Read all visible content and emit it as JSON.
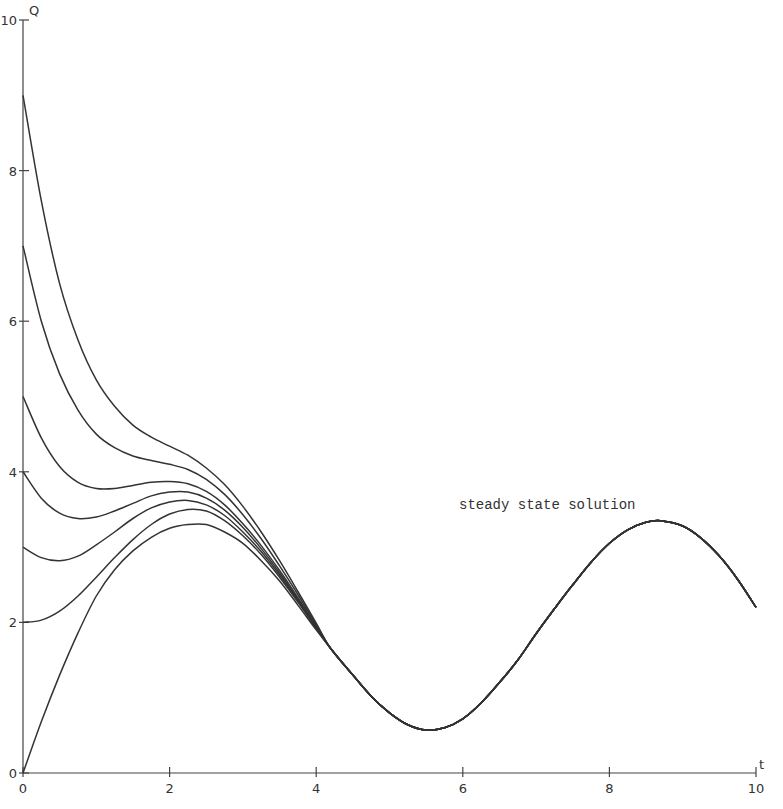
{
  "chart_data": {
    "type": "line",
    "title": "",
    "xlabel": "t",
    "ylabel": "Q",
    "xlim": [
      0,
      10
    ],
    "ylim": [
      0,
      10
    ],
    "x_ticks": [
      0,
      2,
      4,
      6,
      8,
      10
    ],
    "y_ticks": [
      0,
      2,
      4,
      6,
      8,
      10
    ],
    "grid": false,
    "legend": null,
    "annotations": [
      {
        "text": "steady state solution",
        "x": 5.95,
        "y": 3.8
      }
    ],
    "steady_state_tail": [
      [
        4.2,
        1.65
      ],
      [
        4.5,
        1.3
      ],
      [
        4.75,
        1.02
      ],
      [
        5.0,
        0.8
      ],
      [
        5.25,
        0.64
      ],
      [
        5.5,
        0.57
      ],
      [
        5.75,
        0.6
      ],
      [
        6.0,
        0.72
      ],
      [
        6.25,
        0.93
      ],
      [
        6.5,
        1.2
      ],
      [
        6.75,
        1.5
      ],
      [
        7.0,
        1.85
      ],
      [
        7.25,
        2.18
      ],
      [
        7.5,
        2.5
      ],
      [
        7.75,
        2.8
      ],
      [
        8.0,
        3.05
      ],
      [
        8.25,
        3.23
      ],
      [
        8.5,
        3.33
      ],
      [
        8.7,
        3.35
      ],
      [
        9.0,
        3.28
      ],
      [
        9.25,
        3.12
      ],
      [
        9.5,
        2.88
      ],
      [
        9.75,
        2.57
      ],
      [
        10.0,
        2.2
      ]
    ],
    "series": [
      {
        "name": "Q(0)=0",
        "initial": 0,
        "points": [
          [
            0,
            0
          ],
          [
            0.25,
            0.68
          ],
          [
            0.5,
            1.3
          ],
          [
            0.75,
            1.86
          ],
          [
            1,
            2.35
          ],
          [
            1.25,
            2.7
          ],
          [
            1.5,
            2.95
          ],
          [
            1.75,
            3.13
          ],
          [
            2,
            3.25
          ],
          [
            2.25,
            3.3
          ],
          [
            2.5,
            3.3
          ],
          [
            2.75,
            3.2
          ],
          [
            3,
            3.05
          ],
          [
            3.25,
            2.82
          ],
          [
            3.5,
            2.55
          ],
          [
            3.75,
            2.23
          ],
          [
            4,
            1.9
          ]
        ]
      },
      {
        "name": "Q(0)=2",
        "initial": 2,
        "points": [
          [
            0,
            2
          ],
          [
            0.25,
            2.03
          ],
          [
            0.5,
            2.15
          ],
          [
            0.75,
            2.35
          ],
          [
            1,
            2.6
          ],
          [
            1.25,
            2.86
          ],
          [
            1.5,
            3.1
          ],
          [
            1.75,
            3.3
          ],
          [
            2,
            3.44
          ],
          [
            2.25,
            3.5
          ],
          [
            2.5,
            3.48
          ],
          [
            2.75,
            3.35
          ],
          [
            3,
            3.15
          ],
          [
            3.25,
            2.9
          ],
          [
            3.5,
            2.6
          ],
          [
            3.75,
            2.27
          ],
          [
            4,
            1.92
          ]
        ]
      },
      {
        "name": "Q(0)=3",
        "initial": 3,
        "points": [
          [
            0,
            3
          ],
          [
            0.25,
            2.86
          ],
          [
            0.5,
            2.82
          ],
          [
            0.75,
            2.88
          ],
          [
            1,
            3.03
          ],
          [
            1.25,
            3.2
          ],
          [
            1.5,
            3.38
          ],
          [
            1.75,
            3.52
          ],
          [
            2,
            3.6
          ],
          [
            2.25,
            3.62
          ],
          [
            2.5,
            3.56
          ],
          [
            2.75,
            3.42
          ],
          [
            3,
            3.2
          ],
          [
            3.25,
            2.94
          ],
          [
            3.5,
            2.63
          ],
          [
            3.75,
            2.29
          ],
          [
            4,
            1.93
          ]
        ]
      },
      {
        "name": "Q(0)=4",
        "initial": 4,
        "points": [
          [
            0,
            4
          ],
          [
            0.25,
            3.65
          ],
          [
            0.5,
            3.45
          ],
          [
            0.75,
            3.38
          ],
          [
            1,
            3.4
          ],
          [
            1.25,
            3.48
          ],
          [
            1.5,
            3.58
          ],
          [
            1.75,
            3.68
          ],
          [
            2,
            3.73
          ],
          [
            2.25,
            3.73
          ],
          [
            2.5,
            3.65
          ],
          [
            2.75,
            3.49
          ],
          [
            3,
            3.26
          ],
          [
            3.25,
            2.98
          ],
          [
            3.5,
            2.66
          ],
          [
            3.75,
            2.31
          ],
          [
            4,
            1.94
          ]
        ]
      },
      {
        "name": "Q(0)=5",
        "initial": 5,
        "points": [
          [
            0,
            5
          ],
          [
            0.25,
            4.45
          ],
          [
            0.5,
            4.07
          ],
          [
            0.75,
            3.86
          ],
          [
            1,
            3.78
          ],
          [
            1.25,
            3.78
          ],
          [
            1.5,
            3.82
          ],
          [
            1.75,
            3.86
          ],
          [
            2,
            3.87
          ],
          [
            2.25,
            3.84
          ],
          [
            2.5,
            3.74
          ],
          [
            2.75,
            3.56
          ],
          [
            3,
            3.31
          ],
          [
            3.25,
            3.02
          ],
          [
            3.5,
            2.69
          ],
          [
            3.75,
            2.33
          ],
          [
            4,
            1.95
          ]
        ]
      },
      {
        "name": "Q(0)=7",
        "initial": 7,
        "points": [
          [
            0,
            7
          ],
          [
            0.25,
            6.0
          ],
          [
            0.5,
            5.3
          ],
          [
            0.75,
            4.82
          ],
          [
            1,
            4.5
          ],
          [
            1.25,
            4.32
          ],
          [
            1.5,
            4.21
          ],
          [
            1.75,
            4.15
          ],
          [
            2,
            4.1
          ],
          [
            2.25,
            4.03
          ],
          [
            2.5,
            3.9
          ],
          [
            2.75,
            3.7
          ],
          [
            3,
            3.43
          ],
          [
            3.25,
            3.11
          ],
          [
            3.5,
            2.75
          ],
          [
            3.75,
            2.37
          ],
          [
            4,
            1.97
          ]
        ]
      },
      {
        "name": "Q(0)=9",
        "initial": 9,
        "points": [
          [
            0,
            9
          ],
          [
            0.25,
            7.6
          ],
          [
            0.5,
            6.5
          ],
          [
            0.75,
            5.75
          ],
          [
            1,
            5.22
          ],
          [
            1.25,
            4.87
          ],
          [
            1.5,
            4.62
          ],
          [
            1.75,
            4.46
          ],
          [
            2,
            4.34
          ],
          [
            2.25,
            4.22
          ],
          [
            2.5,
            4.05
          ],
          [
            2.75,
            3.83
          ],
          [
            3,
            3.54
          ],
          [
            3.25,
            3.2
          ],
          [
            3.5,
            2.82
          ],
          [
            3.75,
            2.41
          ],
          [
            4,
            1.99
          ]
        ]
      }
    ]
  },
  "axes": {
    "x_label": "t",
    "y_label": "Q",
    "x_tick_labels": [
      "0",
      "2",
      "4",
      "6",
      "8",
      "10"
    ],
    "y_tick_labels": [
      "0",
      "2",
      "4",
      "6",
      "8",
      "10"
    ]
  },
  "annotation_text": "steady state solution"
}
